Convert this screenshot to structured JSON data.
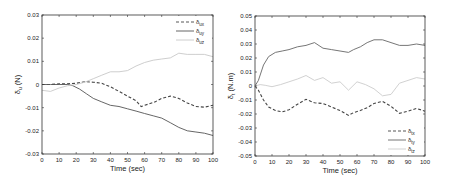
{
  "chart_data": [
    {
      "type": "line",
      "title": "",
      "xlabel": "Time (sec)",
      "ylabel": "δu (N)",
      "ylabel_main": "δ",
      "ylabel_sub": "u",
      "ylabel_unit": " (N)",
      "xlim": [
        0,
        100
      ],
      "ylim": [
        -0.03,
        0.03
      ],
      "xticks": [
        0,
        10,
        20,
        30,
        40,
        50,
        60,
        70,
        80,
        90,
        100
      ],
      "yticks": [
        -0.03,
        -0.02,
        -0.01,
        0,
        0.01,
        0.02,
        0.03
      ],
      "ytick_labels": [
        "-0.03",
        "-0.02",
        "-0.01",
        "0",
        "0.01",
        "0.02",
        "0.03"
      ],
      "grid": false,
      "legend_position": "upper right",
      "box": {
        "x": 42,
        "y": 15,
        "w": 171,
        "h": 139
      },
      "series": [
        {
          "name": "δux",
          "main": "δ",
          "sub": "ux",
          "style": "dashed",
          "color": "#444444",
          "x": [
            0,
            5,
            10,
            15,
            20,
            25,
            30,
            35,
            40,
            45,
            50,
            55,
            58,
            62,
            66,
            70,
            75,
            80,
            85,
            90,
            95,
            100
          ],
          "values": [
            0,
            0,
            0.0003,
            0.0003,
            0.0005,
            0.0012,
            0.001,
            0.0005,
            -0.001,
            -0.003,
            -0.005,
            -0.007,
            -0.0095,
            -0.0085,
            -0.0075,
            -0.006,
            -0.005,
            -0.006,
            -0.008,
            -0.0095,
            -0.0098,
            -0.009
          ]
        },
        {
          "name": "δuy",
          "main": "δ",
          "sub": "uy",
          "style": "solid",
          "color": "#555555",
          "x": [
            0,
            5,
            10,
            15,
            18,
            22,
            26,
            30,
            35,
            40,
            45,
            50,
            55,
            60,
            65,
            70,
            75,
            80,
            85,
            90,
            95,
            100
          ],
          "values": [
            0,
            0,
            0,
            0,
            -0.0005,
            -0.002,
            -0.004,
            -0.006,
            -0.0075,
            -0.009,
            -0.0095,
            -0.0105,
            -0.0115,
            -0.0125,
            -0.0135,
            -0.0145,
            -0.0165,
            -0.0185,
            -0.02,
            -0.0205,
            -0.021,
            -0.022
          ]
        },
        {
          "name": "δuz",
          "main": "δ",
          "sub": "uz",
          "style": "solid",
          "color": "#c8c8c8",
          "x": [
            0,
            5,
            10,
            15,
            20,
            25,
            30,
            35,
            40,
            45,
            50,
            55,
            60,
            65,
            70,
            75,
            80,
            85,
            90,
            95,
            100
          ],
          "values": [
            -0.0025,
            -0.003,
            -0.0015,
            -0.0005,
            0,
            0.001,
            0.0025,
            0.004,
            0.0055,
            0.0055,
            0.006,
            0.008,
            0.0095,
            0.0105,
            0.011,
            0.0115,
            0.0135,
            0.013,
            0.013,
            0.013,
            0.012
          ]
        }
      ]
    },
    {
      "type": "line",
      "title": "",
      "xlabel": "Time (sec)",
      "ylabel": "δt (N.m)",
      "ylabel_main": "δ",
      "ylabel_sub": "t",
      "ylabel_unit": " (N.m)",
      "xlim": [
        0,
        100
      ],
      "ylim": [
        -0.05,
        0.05
      ],
      "xticks": [
        0,
        10,
        20,
        30,
        40,
        50,
        60,
        70,
        80,
        90,
        100
      ],
      "yticks": [
        -0.05,
        -0.04,
        -0.03,
        -0.02,
        -0.01,
        0,
        0.01,
        0.02,
        0.03,
        0.04,
        0.05
      ],
      "ytick_labels": [
        "-0.05",
        "-0.04",
        "-0.03",
        "-0.02",
        "-0.01",
        "0",
        "0.01",
        "0.02",
        "0.03",
        "0.04",
        "0.05"
      ],
      "grid": false,
      "legend_position": "lower right",
      "box": {
        "x": 255,
        "y": 16,
        "w": 170,
        "h": 140
      },
      "series": [
        {
          "name": "δtx",
          "main": "δ",
          "sub": "tx",
          "style": "dashed",
          "color": "#444444",
          "x": [
            0,
            2,
            5,
            8,
            12,
            16,
            20,
            25,
            30,
            35,
            40,
            45,
            50,
            55,
            58,
            62,
            66,
            70,
            75,
            80,
            85,
            90,
            95,
            100
          ],
          "values": [
            0,
            -0.003,
            -0.01,
            -0.015,
            -0.0175,
            -0.0185,
            -0.017,
            -0.013,
            -0.0095,
            -0.012,
            -0.0125,
            -0.015,
            -0.0175,
            -0.021,
            -0.019,
            -0.0175,
            -0.0155,
            -0.0125,
            -0.011,
            -0.0145,
            -0.0195,
            -0.018,
            -0.016,
            -0.018
          ]
        },
        {
          "name": "δty",
          "main": "δ",
          "sub": "ty",
          "style": "solid",
          "color": "#666666",
          "x": [
            0,
            2,
            5,
            8,
            12,
            16,
            20,
            25,
            30,
            35,
            40,
            45,
            50,
            55,
            58,
            62,
            66,
            70,
            75,
            80,
            85,
            90,
            95,
            100
          ],
          "values": [
            0,
            0.004,
            0.015,
            0.021,
            0.024,
            0.025,
            0.026,
            0.028,
            0.029,
            0.031,
            0.027,
            0.026,
            0.025,
            0.024,
            0.026,
            0.028,
            0.031,
            0.033,
            0.033,
            0.031,
            0.029,
            0.029,
            0.03,
            0.029
          ]
        },
        {
          "name": "δtz",
          "main": "δ",
          "sub": "tz",
          "style": "solid",
          "color": "#cccccc",
          "x": [
            0,
            3,
            6,
            10,
            15,
            20,
            25,
            30,
            35,
            40,
            45,
            50,
            55,
            60,
            65,
            70,
            75,
            80,
            85,
            90,
            95,
            100
          ],
          "values": [
            0,
            0.001,
            0.0005,
            -0.0005,
            0.001,
            0.003,
            0.005,
            0.0075,
            0.004,
            0.006,
            0.002,
            0.003,
            -0.003,
            0.003,
            0.001,
            -0.002,
            -0.007,
            -0.006,
            0.002,
            0.004,
            0.006,
            0.005
          ]
        }
      ]
    }
  ]
}
